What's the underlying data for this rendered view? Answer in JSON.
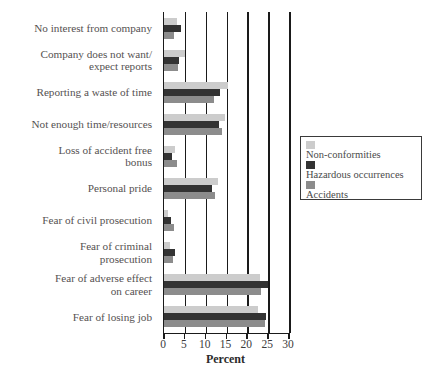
{
  "chart_data": {
    "type": "bar",
    "orientation": "horizontal",
    "title": "",
    "xlabel": "Percent",
    "ylabel": "",
    "xlim": [
      0,
      30
    ],
    "xticks": [
      0,
      5,
      10,
      15,
      20,
      25,
      30
    ],
    "grid": true,
    "legend_position": "right-middle",
    "categories": [
      "No interest from company",
      "Company does not want/\nexpect reports",
      "Reporting a waste of time",
      "Not enough time/resources",
      "Loss of accident free\nbonus",
      "Personal pride",
      "Fear of civil prosecution",
      "Fear of criminal\nprosecution",
      "Fear of adverse effect\non career",
      "Fear of losing job"
    ],
    "series": [
      {
        "name": "Non-conformities",
        "color": "#cccccc",
        "values": [
          3.2,
          5.0,
          15.3,
          14.6,
          2.6,
          12.9,
          1.0,
          1.4,
          23.0,
          22.6
        ]
      },
      {
        "name": "Hazardous occurrences",
        "color": "#333333",
        "values": [
          4.1,
          3.5,
          13.4,
          13.1,
          2.0,
          11.5,
          1.6,
          2.7,
          25.0,
          24.5
        ]
      },
      {
        "name": "Accidents",
        "color": "#8c8c8c",
        "values": [
          2.3,
          3.4,
          12.1,
          13.9,
          3.1,
          12.3,
          2.5,
          2.2,
          23.3,
          24.3
        ]
      }
    ]
  },
  "legend": {
    "entries": [
      {
        "label": "Non-conformities"
      },
      {
        "label": "Hazardous occurrences"
      },
      {
        "label": "Accidents"
      }
    ]
  },
  "axis": {
    "x_title": "Percent",
    "tick_labels": [
      "0",
      "5",
      "10",
      "15",
      "20",
      "25",
      "30"
    ]
  },
  "caption": {
    "text": ""
  }
}
